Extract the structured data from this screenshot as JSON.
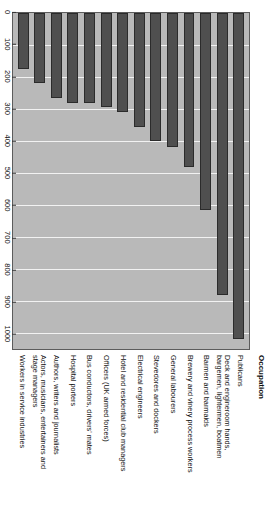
{
  "chart_data": {
    "type": "bar",
    "orientation": "vertical",
    "title": "",
    "subtitle": "",
    "xlabel": "Occupation",
    "ylabel": "SMR 100",
    "ylim": [
      0,
      1050
    ],
    "grid": true,
    "legend": null,
    "y_ticks": [
      0,
      100,
      200,
      300,
      400,
      500,
      600,
      700,
      800,
      900,
      1000
    ],
    "categories": [
      "Publicans",
      "Deck and engineroom hands, bargemen, lightermen, boatmen",
      "Barmen and barmaids",
      "Brewery and vinery process workers",
      "General labourers",
      "Stevedores and dockers",
      "Electrical engineers",
      "Hotel and residential club managers",
      "Officers (UK armed forces)",
      "Bus conductors, drivers' mates",
      "Hospital porters",
      "Authors, writers and journalists",
      "Actors, musicians, entertainers and stage managers",
      "Workers in service industries"
    ],
    "values": [
      1020,
      880,
      615,
      480,
      420,
      400,
      355,
      310,
      295,
      280,
      280,
      265,
      220,
      175
    ],
    "colors": {
      "bar_fill": "#4f4f4f",
      "bar_edge": "#2b2b2b",
      "plot_background": "#b9b9b9",
      "gridline": "#f2f2f2",
      "axis": "#5c5c5c"
    }
  },
  "axes": {
    "category_axis_title": "Occupation",
    "value_axis_title": "SMR 100",
    "value_ticks": [
      "0",
      "100",
      "200",
      "300",
      "400",
      "500",
      "600",
      "700",
      "800",
      "900",
      "1000"
    ]
  },
  "category_labels": [
    {
      "lines": [
        "Publicans"
      ]
    },
    {
      "lines": [
        "Deck and engineroom hands,",
        "bargemen, lightermen, boatmen"
      ]
    },
    {
      "lines": [
        "Barmen and barmaids"
      ]
    },
    {
      "lines": [
        "Brewery and vinery process workers"
      ]
    },
    {
      "lines": [
        "General labourers"
      ]
    },
    {
      "lines": [
        "Stevedores and dockers"
      ]
    },
    {
      "lines": [
        "Electrical engineers"
      ]
    },
    {
      "lines": [
        "Hotel and residential club managers"
      ]
    },
    {
      "lines": [
        "Officers (UK armed forces)"
      ]
    },
    {
      "lines": [
        "Bus conductors, drivers' mates"
      ]
    },
    {
      "lines": [
        "Hospital porters"
      ]
    },
    {
      "lines": [
        "Authors, writers and journalists"
      ]
    },
    {
      "lines": [
        "Actors, musicians, entertainers and",
        "stage managers"
      ]
    },
    {
      "lines": [
        "Workers in service industries"
      ]
    }
  ]
}
